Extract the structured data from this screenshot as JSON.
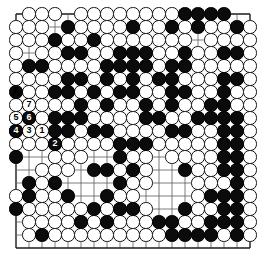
{
  "diagram": {
    "kind": "go-board-diagram",
    "board_size": 19,
    "colors": {
      "background": "#ffffff",
      "grid_line": "#5a5a5a",
      "border_line": "#1a1a1a",
      "black_stone": "#0b0b0b",
      "white_stone": "#ffffff",
      "white_stone_edge": "#111111",
      "label_on_black": "#ffffff",
      "label_on_white": "#000000"
    },
    "geometry": {
      "origin_x": 16,
      "origin_y": 14,
      "spacing": 13,
      "stone_radius": 6.6,
      "hoshi_radius": 1.6,
      "hoshi_points": [
        [
          3,
          3
        ],
        [
          9,
          3
        ],
        [
          15,
          3
        ],
        [
          3,
          9
        ],
        [
          9,
          9
        ],
        [
          15,
          9
        ],
        [
          3,
          15
        ],
        [
          9,
          15
        ],
        [
          15,
          15
        ]
      ]
    },
    "move_labels": [
      {
        "label": "1",
        "color": "white",
        "col": 2,
        "row": 9
      },
      {
        "label": "2",
        "color": "black",
        "col": 3,
        "row": 10
      },
      {
        "label": "3",
        "color": "white",
        "col": 1,
        "row": 9
      },
      {
        "label": "4",
        "color": "black",
        "col": 0,
        "row": 9
      },
      {
        "label": "5",
        "color": "white",
        "col": 0,
        "row": 8
      },
      {
        "label": "6",
        "color": "black",
        "col": 1,
        "row": 8
      },
      {
        "label": "7",
        "color": "white",
        "col": 1,
        "row": 7
      }
    ],
    "point_markers": [
      {
        "label": "A",
        "col": 0,
        "row": 6
      }
    ],
    "black_stones": [
      [
        4,
        1
      ],
      [
        9,
        1
      ],
      [
        13,
        0
      ],
      [
        14,
        0
      ],
      [
        15,
        0
      ],
      [
        16,
        0
      ],
      [
        17,
        1
      ],
      [
        3,
        2
      ],
      [
        12,
        1
      ],
      [
        14,
        1
      ],
      [
        4,
        3
      ],
      [
        2,
        4
      ],
      [
        6,
        2
      ],
      [
        1,
        4
      ],
      [
        5,
        3
      ],
      [
        8,
        3
      ],
      [
        9,
        3
      ],
      [
        10,
        3
      ],
      [
        13,
        3
      ],
      [
        16,
        3
      ],
      [
        17,
        3
      ],
      [
        7,
        4
      ],
      [
        8,
        4
      ],
      [
        9,
        4
      ],
      [
        10,
        4
      ],
      [
        12,
        4
      ],
      [
        13,
        4
      ],
      [
        4,
        5
      ],
      [
        5,
        5
      ],
      [
        7,
        5
      ],
      [
        9,
        5
      ],
      [
        11,
        5
      ],
      [
        12,
        5
      ],
      [
        16,
        5
      ],
      [
        17,
        5
      ],
      [
        0,
        6
      ],
      [
        3,
        6
      ],
      [
        4,
        6
      ],
      [
        6,
        6
      ],
      [
        8,
        6
      ],
      [
        9,
        6
      ],
      [
        12,
        6
      ],
      [
        13,
        6
      ],
      [
        16,
        6
      ],
      [
        1,
        7
      ],
      [
        5,
        7
      ],
      [
        7,
        7
      ],
      [
        10,
        7
      ],
      [
        12,
        7
      ],
      [
        15,
        7
      ],
      [
        16,
        7
      ],
      [
        0,
        9
      ],
      [
        1,
        8
      ],
      [
        3,
        8
      ],
      [
        4,
        8
      ],
      [
        5,
        8
      ],
      [
        10,
        8
      ],
      [
        11,
        8
      ],
      [
        14,
        8
      ],
      [
        15,
        8
      ],
      [
        16,
        8
      ],
      [
        17,
        8
      ],
      [
        2,
        9
      ],
      [
        3,
        9
      ],
      [
        4,
        9
      ],
      [
        6,
        9
      ],
      [
        7,
        9
      ],
      [
        12,
        9
      ],
      [
        13,
        9
      ],
      [
        16,
        9
      ],
      [
        17,
        9
      ],
      [
        3,
        10
      ],
      [
        8,
        10
      ],
      [
        9,
        10
      ],
      [
        10,
        10
      ],
      [
        16,
        10
      ],
      [
        17,
        10
      ],
      [
        0,
        11
      ],
      [
        8,
        11
      ],
      [
        16,
        11
      ],
      [
        17,
        11
      ],
      [
        6,
        12
      ],
      [
        7,
        12
      ],
      [
        9,
        12
      ],
      [
        13,
        12
      ],
      [
        16,
        12
      ],
      [
        17,
        12
      ],
      [
        1,
        13
      ],
      [
        3,
        13
      ],
      [
        8,
        13
      ],
      [
        17,
        13
      ],
      [
        1,
        14
      ],
      [
        4,
        14
      ],
      [
        7,
        14
      ],
      [
        15,
        14
      ],
      [
        16,
        14
      ],
      [
        17,
        14
      ],
      [
        0,
        15
      ],
      [
        6,
        15
      ],
      [
        8,
        15
      ],
      [
        9,
        15
      ],
      [
        13,
        15
      ],
      [
        16,
        15
      ],
      [
        17,
        15
      ],
      [
        5,
        16
      ],
      [
        7,
        16
      ],
      [
        15,
        16
      ],
      [
        16,
        16
      ],
      [
        17,
        16
      ],
      [
        2,
        17
      ],
      [
        12,
        17
      ],
      [
        13,
        17
      ],
      [
        14,
        17
      ],
      [
        15,
        17
      ],
      [
        17,
        17
      ],
      [
        11,
        16
      ],
      [
        12,
        16
      ],
      [
        17,
        12
      ]
    ],
    "white_stones": [
      [
        1,
        0
      ],
      [
        2,
        0
      ],
      [
        3,
        0
      ],
      [
        5,
        0
      ],
      [
        6,
        0
      ],
      [
        7,
        0
      ],
      [
        8,
        0
      ],
      [
        9,
        0
      ],
      [
        10,
        0
      ],
      [
        11,
        0
      ],
      [
        12,
        0
      ],
      [
        0,
        1
      ],
      [
        1,
        1
      ],
      [
        2,
        1
      ],
      [
        5,
        1
      ],
      [
        6,
        1
      ],
      [
        7,
        1
      ],
      [
        8,
        1
      ],
      [
        10,
        1
      ],
      [
        11,
        1
      ],
      [
        13,
        1
      ],
      [
        15,
        1
      ],
      [
        16,
        1
      ],
      [
        18,
        1
      ],
      [
        0,
        2
      ],
      [
        1,
        2
      ],
      [
        2,
        2
      ],
      [
        4,
        2
      ],
      [
        5,
        2
      ],
      [
        7,
        2
      ],
      [
        8,
        2
      ],
      [
        9,
        2
      ],
      [
        10,
        2
      ],
      [
        11,
        2
      ],
      [
        12,
        2
      ],
      [
        13,
        2
      ],
      [
        15,
        2
      ],
      [
        16,
        2
      ],
      [
        17,
        2
      ],
      [
        18,
        2
      ],
      [
        0,
        3
      ],
      [
        2,
        3
      ],
      [
        3,
        3
      ],
      [
        6,
        3
      ],
      [
        7,
        3
      ],
      [
        11,
        3
      ],
      [
        12,
        3
      ],
      [
        14,
        3
      ],
      [
        15,
        3
      ],
      [
        18,
        3
      ],
      [
        0,
        4
      ],
      [
        3,
        4
      ],
      [
        4,
        4
      ],
      [
        5,
        4
      ],
      [
        6,
        4
      ],
      [
        11,
        4
      ],
      [
        14,
        4
      ],
      [
        15,
        4
      ],
      [
        16,
        4
      ],
      [
        17,
        4
      ],
      [
        18,
        4
      ],
      [
        0,
        5
      ],
      [
        1,
        5
      ],
      [
        2,
        5
      ],
      [
        3,
        5
      ],
      [
        6,
        5
      ],
      [
        8,
        5
      ],
      [
        10,
        5
      ],
      [
        13,
        5
      ],
      [
        14,
        5
      ],
      [
        15,
        5
      ],
      [
        18,
        5
      ],
      [
        1,
        6
      ],
      [
        2,
        6
      ],
      [
        5,
        6
      ],
      [
        7,
        6
      ],
      [
        10,
        6
      ],
      [
        11,
        6
      ],
      [
        14,
        6
      ],
      [
        15,
        6
      ],
      [
        17,
        6
      ],
      [
        18,
        6
      ],
      [
        0,
        7
      ],
      [
        2,
        7
      ],
      [
        3,
        7
      ],
      [
        4,
        7
      ],
      [
        6,
        7
      ],
      [
        8,
        7
      ],
      [
        9,
        7
      ],
      [
        11,
        7
      ],
      [
        13,
        7
      ],
      [
        14,
        7
      ],
      [
        17,
        7
      ],
      [
        18,
        7
      ],
      [
        0,
        8
      ],
      [
        2,
        8
      ],
      [
        6,
        8
      ],
      [
        7,
        8
      ],
      [
        8,
        8
      ],
      [
        9,
        8
      ],
      [
        12,
        8
      ],
      [
        13,
        8
      ],
      [
        18,
        8
      ],
      [
        1,
        9
      ],
      [
        5,
        9
      ],
      [
        8,
        9
      ],
      [
        9,
        9
      ],
      [
        10,
        9
      ],
      [
        11,
        9
      ],
      [
        14,
        9
      ],
      [
        15,
        9
      ],
      [
        18,
        9
      ],
      [
        0,
        10
      ],
      [
        1,
        10
      ],
      [
        2,
        10
      ],
      [
        4,
        10
      ],
      [
        5,
        10
      ],
      [
        6,
        10
      ],
      [
        7,
        10
      ],
      [
        11,
        10
      ],
      [
        12,
        10
      ],
      [
        13,
        10
      ],
      [
        14,
        10
      ],
      [
        15,
        10
      ],
      [
        18,
        10
      ],
      [
        3,
        11
      ],
      [
        4,
        11
      ],
      [
        5,
        11
      ],
      [
        9,
        11
      ],
      [
        10,
        11
      ],
      [
        12,
        11
      ],
      [
        13,
        11
      ],
      [
        14,
        11
      ],
      [
        15,
        11
      ],
      [
        18,
        11
      ],
      [
        2,
        12
      ],
      [
        3,
        12
      ],
      [
        4,
        12
      ],
      [
        8,
        12
      ],
      [
        10,
        12
      ],
      [
        14,
        12
      ],
      [
        15,
        12
      ],
      [
        18,
        12
      ],
      [
        2,
        13
      ],
      [
        9,
        13
      ],
      [
        10,
        13
      ],
      [
        14,
        13
      ],
      [
        15,
        13
      ],
      [
        16,
        13
      ],
      [
        18,
        13
      ],
      [
        0,
        14
      ],
      [
        2,
        14
      ],
      [
        3,
        14
      ],
      [
        8,
        14
      ],
      [
        9,
        14
      ],
      [
        14,
        14
      ],
      [
        18,
        14
      ],
      [
        1,
        15
      ],
      [
        2,
        15
      ],
      [
        3,
        15
      ],
      [
        4,
        15
      ],
      [
        5,
        15
      ],
      [
        7,
        15
      ],
      [
        10,
        15
      ],
      [
        14,
        15
      ],
      [
        15,
        15
      ],
      [
        18,
        15
      ],
      [
        1,
        16
      ],
      [
        2,
        16
      ],
      [
        3,
        16
      ],
      [
        4,
        16
      ],
      [
        6,
        16
      ],
      [
        8,
        16
      ],
      [
        9,
        16
      ],
      [
        10,
        16
      ],
      [
        13,
        16
      ],
      [
        14,
        16
      ],
      [
        18,
        16
      ],
      [
        1,
        17
      ],
      [
        3,
        17
      ],
      [
        4,
        17
      ],
      [
        5,
        17
      ],
      [
        6,
        17
      ],
      [
        7,
        17
      ],
      [
        8,
        17
      ],
      [
        9,
        17
      ],
      [
        10,
        17
      ],
      [
        11,
        17
      ],
      [
        16,
        17
      ],
      [
        18,
        17
      ]
    ]
  }
}
